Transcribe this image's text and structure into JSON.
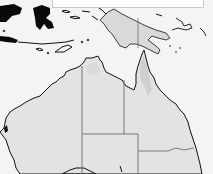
{
  "map": {
    "region": "Australia and Papua New Guinea",
    "style": "grayscale shaded relief",
    "colors": {
      "ocean": "#f4f4f4",
      "land": "#e3e3e3",
      "land_highlands": "#cfcfcf",
      "coastline": "#111111",
      "borders": "#6e6e6e",
      "dark_landmass": "#0a0a0a"
    },
    "features": [
      {
        "name": "Australia",
        "type": "landmass"
      },
      {
        "name": "Papua New Guinea",
        "type": "landmass"
      },
      {
        "name": "Indonesia islands",
        "type": "landmass"
      },
      {
        "name": "Western Australia / Northern Territory border",
        "type": "state-border"
      },
      {
        "name": "Northern Territory / Queensland border",
        "type": "state-border"
      },
      {
        "name": "South Australia northern border",
        "type": "state-border"
      },
      {
        "name": "New South Wales northern border",
        "type": "state-border"
      },
      {
        "name": "Papua / PNG border",
        "type": "country-border"
      }
    ],
    "labels": []
  }
}
